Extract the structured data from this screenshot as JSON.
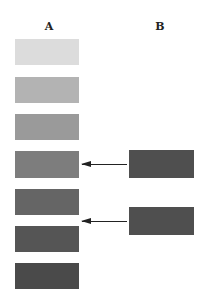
{
  "columns": {
    "a": {
      "label": "A"
    },
    "b": {
      "label": "B"
    }
  },
  "column_a_swatches": [
    {
      "index": 1,
      "color": "#dcdcdc"
    },
    {
      "index": 2,
      "color": "#b3b3b3"
    },
    {
      "index": 3,
      "color": "#9a9a9a"
    },
    {
      "index": 4,
      "color": "#7d7d7d"
    },
    {
      "index": 5,
      "color": "#656565"
    },
    {
      "index": 6,
      "color": "#555555"
    },
    {
      "index": 7,
      "color": "#4a4a4a"
    }
  ],
  "column_b_swatches": [
    {
      "index": 1,
      "color": "#4f4f4f",
      "points_to": "A4"
    },
    {
      "index": 2,
      "color": "#4f4f4f",
      "points_to": "between A5 and A6"
    }
  ],
  "arrows": [
    {
      "from": "B1",
      "to": "A4",
      "direction": "left"
    },
    {
      "from": "B2",
      "to": "A5-A6 gap",
      "direction": "left"
    }
  ]
}
